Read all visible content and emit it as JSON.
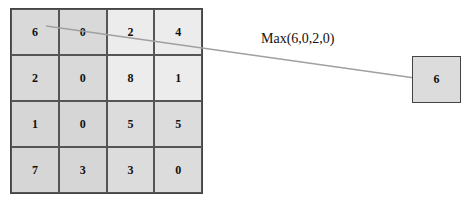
{
  "diagram": {
    "input_grid": {
      "rows": [
        [
          "6",
          "0",
          "2",
          "4"
        ],
        [
          "2",
          "0",
          "8",
          "1"
        ],
        [
          "1",
          "0",
          "5",
          "5"
        ],
        [
          "7",
          "3",
          "3",
          "0"
        ]
      ],
      "quadrant_colors": {
        "top_left": "#d9d9d9",
        "top_right": "#ececec",
        "bottom_left": "#d6d6d6",
        "bottom_right": "#dcdcdc"
      }
    },
    "operation_label": "Max(6,0,2,0)",
    "output_value": "6",
    "arrow_color": "#a0a0a0"
  }
}
